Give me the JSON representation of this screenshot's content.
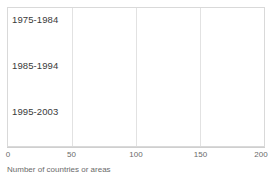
{
  "chart_data": {
    "type": "bar",
    "orientation": "horizontal",
    "stacked": true,
    "title": "",
    "subtitle": "",
    "xlabel": "Number of countries or areas",
    "ylabel": "",
    "xlim": [
      0,
      200
    ],
    "ylim": null,
    "grid": true,
    "legend_position": "none",
    "xticks": [
      0,
      50,
      100,
      150,
      200
    ],
    "xtick_labels": [
      "0",
      "50",
      "100",
      "150",
      "200"
    ],
    "categories": [
      "1975-1984",
      "1985-1994",
      "1995-2003"
    ],
    "series": [
      {
        "name": "series-1",
        "color": "#7f7f7f",
        "values": [
          76,
          85,
          81
        ]
      },
      {
        "name": "series-2",
        "color": "#b8b8b8",
        "values": [
          11,
          9,
          10
        ]
      }
    ],
    "totals": [
      87,
      94,
      91
    ],
    "annotations": []
  },
  "colors": {
    "segment_dark": "#7f7f7f",
    "segment_light": "#b8b8b8",
    "frame": "#d9d9d9",
    "gridline": "#e2e2e2",
    "axis": "#cfcfcf",
    "tick_text": "#6a6a6a",
    "category_text": "#3a3a3a",
    "background": "#ffffff"
  }
}
